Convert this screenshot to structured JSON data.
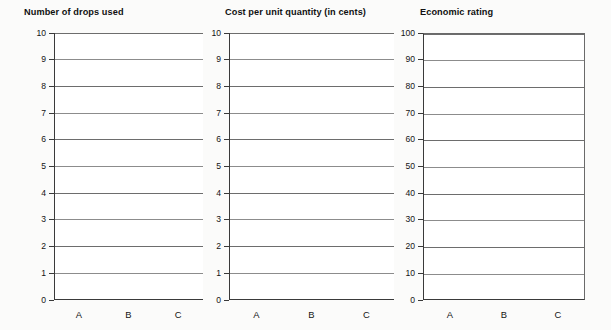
{
  "page": {
    "background": "#fbfbfa",
    "bar_color": "#c9c9c9",
    "axis_color": "#3a3a3a",
    "grid_color": "#6d6d6d"
  },
  "chart_data": [
    {
      "type": "bar",
      "title": "Number of drops used",
      "categories": [
        "A",
        "B",
        "C"
      ],
      "values": [
        8,
        4,
        6
      ],
      "xlabel": "",
      "ylabel": "",
      "ylim": [
        0,
        10
      ],
      "yticks": [
        0,
        1,
        2,
        3,
        4,
        5,
        6,
        7,
        8,
        9,
        10
      ],
      "ytick_labels": [
        "0",
        "1",
        "2",
        "3",
        "4",
        "5",
        "6",
        "7",
        "8",
        "9",
        "10"
      ],
      "grid": true,
      "legend": "none",
      "frame": "left-bottom"
    },
    {
      "type": "bar",
      "title": "Cost per unit quantity (in cents)",
      "categories": [
        "A",
        "B",
        "C"
      ],
      "values": [
        4,
        7,
        5
      ],
      "xlabel": "",
      "ylabel": "",
      "ylim": [
        0,
        10
      ],
      "yticks": [
        0,
        1,
        2,
        3,
        4,
        5,
        6,
        7,
        8,
        9,
        10
      ],
      "ytick_labels": [
        "0",
        "1",
        "2",
        "3",
        "4",
        "5",
        "6",
        "7",
        "8",
        "9",
        "10"
      ],
      "grid": true,
      "legend": "none",
      "frame": "left-bottom"
    },
    {
      "type": "bar",
      "title": "Economic rating",
      "categories": [
        "A",
        "B",
        "C"
      ],
      "values": [
        31,
        26.5,
        30
      ],
      "xlabel": "",
      "ylabel": "",
      "ylim": [
        0,
        100
      ],
      "yticks": [
        0,
        10,
        20,
        30,
        40,
        50,
        60,
        70,
        80,
        90,
        100
      ],
      "ytick_labels": [
        "0",
        "10",
        "20",
        "30",
        "40",
        "50",
        "60",
        "70",
        "80",
        "90",
        "100"
      ],
      "grid": true,
      "legend": "none",
      "frame": "full-box"
    }
  ]
}
